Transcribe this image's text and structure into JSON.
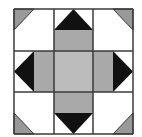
{
  "diagram": {
    "type": "quilt-block",
    "grid": {
      "rows": 3,
      "cols": 3
    },
    "bounds": {
      "x0": 14,
      "y0": 9,
      "x1": 133,
      "y1": 134
    },
    "gridlines": {
      "x": [
        14,
        54,
        93,
        133
      ],
      "y": [
        9,
        51,
        92,
        134
      ]
    },
    "colors": {
      "background": "#ffffff",
      "line": "#3a3a3a",
      "center": "#bcbcbc",
      "arm": "#a9a9a9",
      "corner": "#999999",
      "point": "#111111"
    },
    "shapes": {
      "corner_triangles": [
        "top-left",
        "top-right",
        "bottom-left",
        "bottom-right"
      ],
      "point_triangles": [
        "top",
        "right",
        "bottom",
        "left"
      ],
      "arm_rects": [
        "top",
        "right",
        "bottom",
        "left"
      ],
      "center_square": "center"
    }
  }
}
